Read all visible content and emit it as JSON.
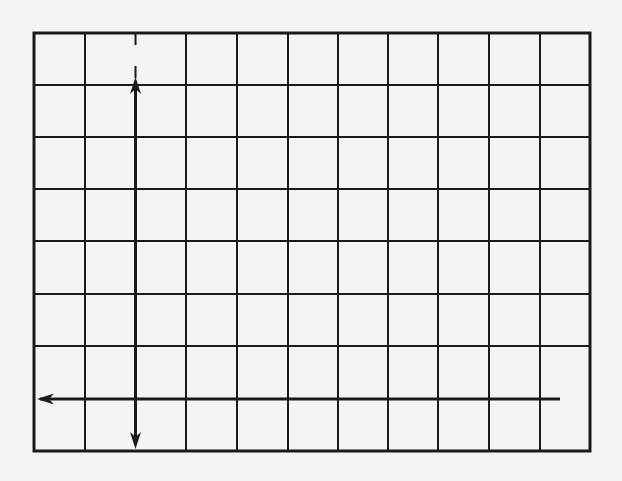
{
  "figure": {
    "equation": {
      "open1": "(",
      "x": "x",
      "minus1": "–",
      "h": "h",
      "close1": ")",
      "exp1": "2",
      "plus": " + ",
      "open2": "(",
      "y": "y",
      "minus2": "–",
      "k": "k",
      "close2": ")",
      "exp2": "2",
      "equals": " = ",
      "r": "r",
      "exp3": "2",
      "full_text": "(x–h)^2 + (y–k)^2 = r^2"
    },
    "axes": {
      "x_label": "x",
      "y_label": "y"
    },
    "radius_label": "r",
    "center_label": {
      "open": "(",
      "h": "h",
      "comma": ",",
      "k": "k",
      "close": ")",
      "full_text": "(h,k)"
    },
    "grid": {
      "columns": 11,
      "rows": 8,
      "line_color": "#1a1a1a",
      "background": "#f4f4f2"
    },
    "colors": {
      "ink": "#1a1a1a",
      "paper": "#f4f4f2"
    }
  }
}
